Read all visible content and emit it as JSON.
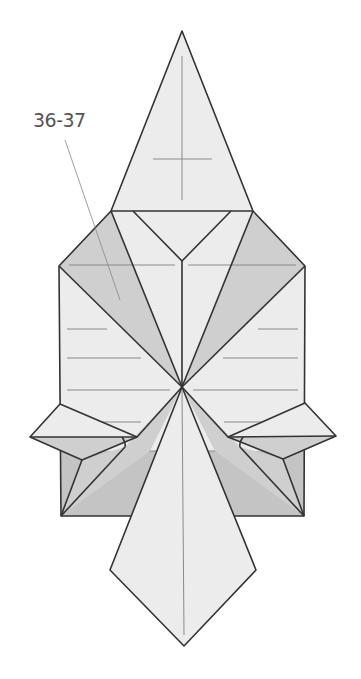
{
  "diagram": {
    "type": "origami-step-diagram",
    "step_reference_label": "36-37",
    "colors": {
      "background": "#ffffff",
      "paper_light": "#ececec",
      "paper_shaded": "#cfcfcf",
      "edge": "#333333",
      "crease": "#8a8a8a",
      "label": "#555555"
    },
    "parts": [
      {
        "name": "top-triangle-flap",
        "shade": "light"
      },
      {
        "name": "left-shaded-flap",
        "shade": "shaded"
      },
      {
        "name": "right-shaded-flap",
        "shade": "shaded"
      },
      {
        "name": "central-square-body",
        "shade": "light"
      },
      {
        "name": "left-wing-point",
        "shade": "light"
      },
      {
        "name": "right-wing-point",
        "shade": "light"
      },
      {
        "name": "bottom-kite-flap",
        "shade": "light"
      }
    ],
    "leader_line": {
      "from": "step-label",
      "to": "left-shaded-flap"
    }
  }
}
